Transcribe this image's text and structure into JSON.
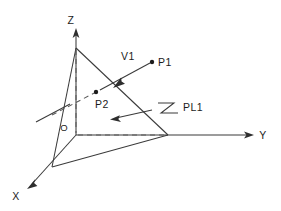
{
  "figure": {
    "kind": "3d-plane-vector-diagram",
    "background_color": "#ffffff",
    "line_color": "#3a3a3a",
    "dash_color": "#5a5a5a",
    "text_color": "#1c1c1c"
  },
  "axes": [
    {
      "id": "z",
      "label": "Z",
      "label_x": 73,
      "label_y": 22
    },
    {
      "id": "y",
      "label": "Y",
      "label_x": 262,
      "label_y": 139
    },
    {
      "id": "x",
      "label": "X",
      "label_x": 14,
      "label_y": 200
    }
  ],
  "origin": {
    "label": "O",
    "label_x": 62,
    "label_y": 131,
    "x": 76,
    "y": 135
  },
  "points": [
    {
      "id": "p1",
      "label": "P1",
      "dot_x": 152,
      "dot_y": 62,
      "label_x": 158,
      "label_y": 66
    },
    {
      "id": "p2",
      "label": "P2",
      "dot_x": 96,
      "dot_y": 92,
      "label_x": 96,
      "label_y": 107
    }
  ],
  "vectors": [
    {
      "id": "v1",
      "label": "V1",
      "label_x": 122,
      "label_y": 59
    }
  ],
  "planes": [
    {
      "id": "pl1",
      "label": "PL1",
      "label_x": 182,
      "label_y": 111
    }
  ],
  "geometry": {
    "z_axis": {
      "x1": 76,
      "y1": 135,
      "x2": 76,
      "y2": 32
    },
    "y_axis": {
      "x1": 76,
      "y1": 135,
      "x2": 252,
      "y2": 135
    },
    "x_axis": {
      "x1": 76,
      "y1": 135,
      "x2": 29,
      "y2": 187
    },
    "triangle": {
      "apex": {
        "x": 76,
        "y": 48
      },
      "left": {
        "x": 52,
        "y": 167
      },
      "right": {
        "x": 168,
        "y": 135
      }
    },
    "vector_line": {
      "x1": 96,
      "y1": 92,
      "x2": 152,
      "y2": 62
    },
    "plane_trace": {
      "x1": 36,
      "y1": 122,
      "x2": 70,
      "y2": 104
    },
    "pl1_arrow": {
      "tip_x": 112,
      "tip_y": 119,
      "tail_x": 152,
      "tail_y": 110
    }
  }
}
